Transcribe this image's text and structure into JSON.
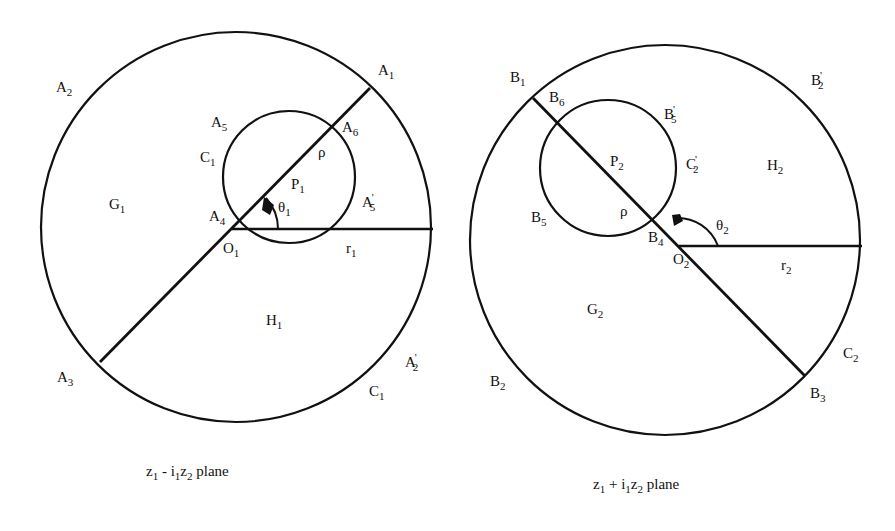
{
  "colors": {
    "ink": "#111111",
    "background": "#ffffff"
  },
  "left_plane": {
    "caption": {
      "z1": "z",
      "z1_sub": "1",
      "op": " - ",
      "i1": "i",
      "i1_sub": "1",
      "z2": "z",
      "z2_sub": "2",
      "suffix": " plane"
    },
    "labels": {
      "A1": {
        "base": "A",
        "sub": "1",
        "prime": ""
      },
      "A2": {
        "base": "A",
        "sub": "2",
        "prime": ""
      },
      "A3": {
        "base": "A",
        "sub": "3",
        "prime": ""
      },
      "A4": {
        "base": "A",
        "sub": "4",
        "prime": ""
      },
      "A5": {
        "base": "A",
        "sub": "5",
        "prime": ""
      },
      "A6": {
        "base": "A",
        "sub": "6",
        "prime": ""
      },
      "A5p": {
        "base": "A",
        "sub": "5",
        "prime": "'"
      },
      "A2p": {
        "base": "A",
        "sub": "2",
        "prime": "'"
      },
      "C1_inner": {
        "base": "C",
        "sub": "1"
      },
      "C1_outer": {
        "base": "C",
        "sub": "1"
      },
      "G1": {
        "base": "G",
        "sub": "1"
      },
      "H1": {
        "base": "H",
        "sub": "1"
      },
      "O1": {
        "base": "O",
        "sub": "1"
      },
      "P1": {
        "base": "P",
        "sub": "1"
      },
      "r1": {
        "base": "r",
        "sub": "1"
      },
      "theta1": {
        "base": "θ",
        "sub": "1"
      },
      "rho": {
        "base": "ρ"
      }
    }
  },
  "right_plane": {
    "caption": {
      "z1": "z",
      "z1_sub": "1",
      "op": " + ",
      "i1": "i",
      "i1_sub": "1",
      "z2": "z",
      "z2_sub": "2",
      "suffix": " plane"
    },
    "labels": {
      "B1": {
        "base": "B",
        "sub": "1",
        "prime": ""
      },
      "B2": {
        "base": "B",
        "sub": "2",
        "prime": ""
      },
      "B3": {
        "base": "B",
        "sub": "3",
        "prime": ""
      },
      "B4": {
        "base": "B",
        "sub": "4",
        "prime": ""
      },
      "B5": {
        "base": "B",
        "sub": "5",
        "prime": ""
      },
      "B6": {
        "base": "B",
        "sub": "6",
        "prime": ""
      },
      "B5p": {
        "base": "B",
        "sub": "5",
        "prime": "'"
      },
      "B2p": {
        "base": "B",
        "sub": "2",
        "prime": "'"
      },
      "C2p": {
        "base": "C",
        "sub": "2",
        "prime": "'"
      },
      "C2": {
        "base": "C",
        "sub": "2"
      },
      "G2": {
        "base": "G",
        "sub": "2"
      },
      "H2": {
        "base": "H",
        "sub": "2"
      },
      "O2": {
        "base": "O",
        "sub": "2"
      },
      "P2": {
        "base": "P",
        "sub": "2"
      },
      "r2": {
        "base": "r",
        "sub": "2"
      },
      "theta2": {
        "base": "θ",
        "sub": "2"
      },
      "rho": {
        "base": "ρ"
      }
    }
  }
}
